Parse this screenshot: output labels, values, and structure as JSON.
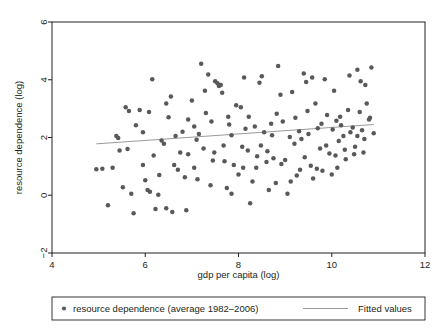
{
  "chart_data": {
    "type": "scatter",
    "title": "",
    "xlabel": "gdp per capita (log)",
    "ylabel": "resource dependence (log)",
    "xlim": [
      4,
      12
    ],
    "ylim": [
      -2,
      6
    ],
    "xticks": [
      4,
      6,
      8,
      10,
      12
    ],
    "yticks": [
      -2,
      0,
      2,
      4,
      6
    ],
    "xtick_labels": [
      "4",
      "6",
      "8",
      "10",
      "12"
    ],
    "ytick_labels": [
      "−2",
      "0",
      "2",
      "4",
      "6"
    ],
    "grid": false,
    "legend_position": "bottom",
    "marker_color": "#58595b",
    "line_color": "#9a9a9a",
    "frame_color": "#231f20",
    "series": [
      {
        "name": "resource dependence (average 1982–2006)",
        "type": "scatter",
        "points": [
          [
            4.95,
            0.9
          ],
          [
            5.08,
            0.92
          ],
          [
            5.2,
            -0.35
          ],
          [
            5.3,
            0.95
          ],
          [
            5.38,
            2.05
          ],
          [
            5.45,
            1.55
          ],
          [
            5.52,
            0.28
          ],
          [
            5.58,
            3.05
          ],
          [
            5.62,
            1.6
          ],
          [
            5.7,
            0.05
          ],
          [
            5.75,
            -0.62
          ],
          [
            5.8,
            2.42
          ],
          [
            5.88,
            2.95
          ],
          [
            5.95,
            1.05
          ],
          [
            6.0,
            0.52
          ],
          [
            6.05,
            0.18
          ],
          [
            6.1,
            0.12
          ],
          [
            6.15,
            4.02
          ],
          [
            6.18,
            1.38
          ],
          [
            6.22,
            -0.48
          ],
          [
            6.3,
            0.7
          ],
          [
            6.35,
            1.9
          ],
          [
            6.4,
            1.78
          ],
          [
            6.45,
            -0.45
          ],
          [
            6.5,
            2.7
          ],
          [
            6.55,
            3.42
          ],
          [
            6.62,
            1.05
          ],
          [
            6.7,
            0.88
          ],
          [
            6.75,
            1.48
          ],
          [
            6.8,
            2.2
          ],
          [
            6.85,
            0.62
          ],
          [
            6.92,
            2.62
          ],
          [
            7.0,
            3.28
          ],
          [
            7.05,
            0.95
          ],
          [
            7.1,
            1.92
          ],
          [
            7.15,
            2.12
          ],
          [
            7.2,
            4.55
          ],
          [
            7.25,
            1.62
          ],
          [
            7.3,
            2.85
          ],
          [
            7.35,
            4.18
          ],
          [
            7.4,
            0.35
          ],
          [
            7.45,
            1.2
          ],
          [
            7.5,
            3.95
          ],
          [
            7.55,
            3.88
          ],
          [
            7.58,
            3.78
          ],
          [
            7.62,
            3.82
          ],
          [
            7.65,
            3.55
          ],
          [
            7.7,
            1.18
          ],
          [
            7.75,
            0.25
          ],
          [
            7.8,
            2.45
          ],
          [
            7.85,
            2.08
          ],
          [
            7.9,
            1.05
          ],
          [
            7.95,
            3.12
          ],
          [
            8.0,
            0.72
          ],
          [
            8.05,
            3.05
          ],
          [
            8.1,
            0.95
          ],
          [
            8.15,
            2.3
          ],
          [
            8.2,
            1.55
          ],
          [
            8.25,
            -0.28
          ],
          [
            8.3,
            0.48
          ],
          [
            8.35,
            2.38
          ],
          [
            8.4,
            1.35
          ],
          [
            8.45,
            3.9
          ],
          [
            8.5,
            4.12
          ],
          [
            8.55,
            2.18
          ],
          [
            8.6,
            1.15
          ],
          [
            8.65,
            0.18
          ],
          [
            8.7,
            2.48
          ],
          [
            8.75,
            1.28
          ],
          [
            8.8,
            0.42
          ],
          [
            8.85,
            4.48
          ],
          [
            8.9,
            3.48
          ],
          [
            8.95,
            2.55
          ],
          [
            9.0,
            1.22
          ],
          [
            9.05,
            0.05
          ],
          [
            9.1,
            2.02
          ],
          [
            9.15,
            3.58
          ],
          [
            9.2,
            1.78
          ],
          [
            9.25,
            0.68
          ],
          [
            9.3,
            2.22
          ],
          [
            9.35,
            1.95
          ],
          [
            9.4,
            4.22
          ],
          [
            9.45,
            3.92
          ],
          [
            9.5,
            2.12
          ],
          [
            9.55,
            1.02
          ],
          [
            9.6,
            0.58
          ],
          [
            9.65,
            3.18
          ],
          [
            9.7,
            2.32
          ],
          [
            9.75,
            1.62
          ],
          [
            9.8,
            0.85
          ],
          [
            9.85,
            4.02
          ],
          [
            9.9,
            2.78
          ],
          [
            9.95,
            1.45
          ],
          [
            10.0,
            0.72
          ],
          [
            10.05,
            3.62
          ],
          [
            10.1,
            2.58
          ],
          [
            10.15,
            1.88
          ],
          [
            10.2,
            2.42
          ],
          [
            10.25,
            2.05
          ],
          [
            10.3,
            1.25
          ],
          [
            10.35,
            2.95
          ],
          [
            10.4,
            2.18
          ],
          [
            10.45,
            2.35
          ],
          [
            10.5,
            1.68
          ],
          [
            10.55,
            4.35
          ],
          [
            10.6,
            2.88
          ],
          [
            10.65,
            2.25
          ],
          [
            10.7,
            1.95
          ],
          [
            10.75,
            3.18
          ],
          [
            10.8,
            2.62
          ],
          [
            10.85,
            4.42
          ],
          [
            10.9,
            2.15
          ],
          [
            5.42,
            1.98
          ],
          [
            6.08,
            2.88
          ],
          [
            6.28,
            0.02
          ],
          [
            6.58,
            -0.58
          ],
          [
            6.88,
            -0.52
          ],
          [
            7.12,
            0.55
          ],
          [
            7.42,
            2.55
          ],
          [
            7.68,
            1.72
          ],
          [
            8.08,
            1.68
          ],
          [
            8.38,
            0.95
          ],
          [
            8.62,
            1.52
          ],
          [
            8.92,
            1.08
          ],
          [
            9.12,
            0.48
          ],
          [
            9.42,
            1.32
          ],
          [
            9.68,
            0.92
          ],
          [
            9.88,
            1.72
          ],
          [
            10.08,
            1.38
          ],
          [
            10.28,
            1.58
          ],
          [
            10.48,
            1.42
          ],
          [
            10.68,
            1.48
          ],
          [
            5.65,
            2.92
          ],
          [
            6.45,
            3.18
          ],
          [
            7.05,
            2.38
          ],
          [
            7.85,
            0.05
          ],
          [
            8.22,
            2.72
          ],
          [
            8.72,
            2.08
          ],
          [
            9.22,
            2.68
          ],
          [
            9.78,
            2.48
          ],
          [
            10.18,
            2.72
          ],
          [
            10.38,
            4.15
          ],
          [
            10.62,
            3.95
          ],
          [
            10.72,
            3.82
          ],
          [
            5.95,
            2.18
          ],
          [
            6.65,
            2.05
          ],
          [
            7.48,
            1.48
          ],
          [
            8.48,
            1.72
          ],
          [
            9.32,
            0.88
          ],
          [
            10.12,
            0.95
          ],
          [
            10.55,
            2.05
          ],
          [
            10.82,
            2.68
          ],
          [
            7.28,
            3.62
          ],
          [
            8.12,
            4.08
          ],
          [
            9.58,
            4.08
          ],
          [
            10.02,
            2.28
          ],
          [
            6.92,
            1.42
          ],
          [
            7.78,
            2.72
          ],
          [
            8.82,
            2.82
          ],
          [
            9.48,
            2.92
          ]
        ]
      },
      {
        "name": "Fitted values",
        "type": "line",
        "x": [
          4.95,
          10.9
        ],
        "y": [
          1.78,
          2.45
        ]
      }
    ]
  },
  "legend": {
    "scatter_label": "resource dependence (average 1982–2006)",
    "line_label": "Fitted values"
  }
}
